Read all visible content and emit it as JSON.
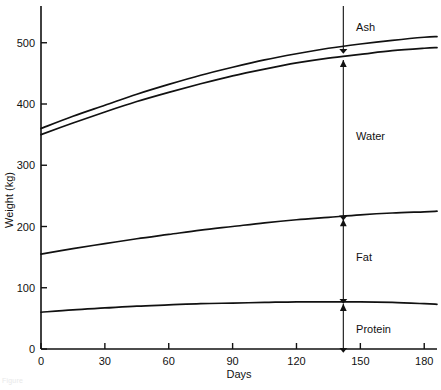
{
  "chart_data": {
    "type": "line",
    "title": "",
    "xlabel": "Days",
    "ylabel": "Weight (kg)",
    "xlim": [
      0,
      186
    ],
    "ylim": [
      0,
      560
    ],
    "xticks": [
      0,
      30,
      60,
      90,
      120,
      150,
      180
    ],
    "xtick_labels": [
      "0",
      "30",
      "60",
      "90",
      "120",
      "150",
      "180"
    ],
    "yticks": [
      0,
      100,
      200,
      300,
      400,
      500
    ],
    "ytick_labels": [
      "0",
      "100",
      "200",
      "300",
      "400",
      "500"
    ],
    "grid": false,
    "legend_position": "none",
    "series": [
      {
        "name": "Total (top of ash band)",
        "x": [
          0,
          15,
          30,
          45,
          60,
          75,
          90,
          105,
          120,
          135,
          150,
          165,
          180,
          186
        ],
        "values": [
          360,
          380,
          398,
          416,
          432,
          447,
          460,
          472,
          482,
          491,
          498,
          504,
          509,
          510
        ]
      },
      {
        "name": "Top of water band (ash lower boundary)",
        "x": [
          0,
          15,
          30,
          45,
          60,
          75,
          90,
          105,
          120,
          135,
          150,
          165,
          180,
          186
        ],
        "values": [
          350,
          369,
          387,
          404,
          419,
          433,
          446,
          457,
          467,
          475,
          481,
          487,
          491,
          492
        ]
      },
      {
        "name": "Top of fat band (water lower boundary)",
        "x": [
          0,
          15,
          30,
          45,
          60,
          75,
          90,
          105,
          120,
          135,
          150,
          165,
          180,
          186
        ],
        "values": [
          155,
          164,
          172,
          180,
          187,
          194,
          200,
          206,
          211,
          215,
          219,
          222,
          224,
          225
        ]
      },
      {
        "name": "Top of protein band (fat lower boundary)",
        "x": [
          0,
          15,
          30,
          45,
          60,
          75,
          90,
          105,
          120,
          135,
          150,
          165,
          180,
          186
        ],
        "values": [
          60,
          64,
          67,
          70,
          72,
          74,
          75,
          76,
          77,
          77,
          77,
          76,
          74,
          73
        ]
      }
    ],
    "annotations": [
      {
        "label": "Ash",
        "at_day": 142,
        "from_value": 560,
        "to_value": 488,
        "label_x_day": 148,
        "label_value": 525
      },
      {
        "label": "Water",
        "at_day": 142,
        "from_value": 472,
        "to_value": 216,
        "label_x_day": 148,
        "label_value": 348
      },
      {
        "label": "Fat",
        "at_day": 142,
        "from_value": 212,
        "to_value": 80,
        "label_x_day": 148,
        "label_value": 150
      },
      {
        "label": "Protein",
        "at_day": 142,
        "from_value": 74,
        "to_value": 0,
        "label_x_day": 148,
        "label_value": 33
      }
    ]
  },
  "caption": {
    "text": "Figure"
  }
}
